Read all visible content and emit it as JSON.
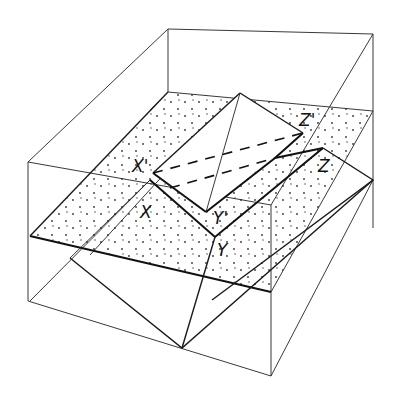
{
  "figure": {
    "type": "3D block diagram",
    "colors": {
      "line": "#111111",
      "background": "#ffffff",
      "stipple": "#333333"
    }
  },
  "labels": {
    "x_prime": "X'",
    "y_prime": "Y'",
    "z_prime": "Z'",
    "x": "X",
    "y": "Y",
    "z": "Z"
  }
}
